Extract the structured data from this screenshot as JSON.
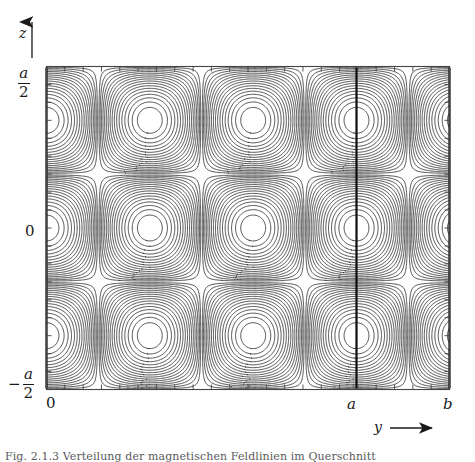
{
  "figure": {
    "type": "contour-plot",
    "axes": {
      "x": {
        "label": "y",
        "arrow": "right",
        "tick_labels": [
          "0",
          "a",
          "b"
        ],
        "tick_values": [
          0,
          1,
          1.3
        ],
        "range": [
          0,
          1.3
        ]
      },
      "y": {
        "label": "z",
        "arrow": "up",
        "tick_labels_top": "a",
        "tick_labels_top_den": "2",
        "tick_label_mid": "0",
        "tick_labels_bottom_sign": "−",
        "tick_labels_bottom": "a",
        "tick_labels_bottom_den": "2",
        "range": [
          -0.5,
          0.5
        ]
      }
    },
    "marker_lines": [
      {
        "name": "y-equals-0",
        "x": 0.0
      },
      {
        "name": "y-equals-a",
        "x": 1.0
      },
      {
        "name": "y-equals-b",
        "x": 1.3
      }
    ],
    "caption_sliver": "Fig. 2.1.3  Verteilung der magnetischen Feldlinien im Querschnitt"
  },
  "chart_data": {
    "type": "contour",
    "title": "",
    "xlabel": "y",
    "ylabel": "z",
    "xlim": [
      0,
      1.3
    ],
    "ylim": [
      -0.5,
      0.5
    ],
    "xticks": [
      0,
      1.0,
      1.3
    ],
    "xticklabels": [
      "0",
      "a",
      "b"
    ],
    "yticks": [
      -0.5,
      0,
      0.5
    ],
    "yticklabels": [
      "-a/2",
      "0",
      "a/2"
    ],
    "grid": false,
    "legend": null,
    "field_description": "Doubly periodic field: three cells along z (centred at z = -a/3, 0, +a/3) and three full cells along y within 0 <= y <= a, with a partly open fourth column between y = a and y = b where contours flatten into the corner.",
    "n_levels": 17,
    "cell_centers_x": [
      0.17,
      0.5,
      0.83,
      1.16
    ],
    "cell_centers_z": [
      0.33,
      0.0,
      -0.33
    ],
    "extrema_count": 9,
    "annotations": [
      {
        "text": "0",
        "axis": "x",
        "value": 0
      },
      {
        "text": "a",
        "axis": "x",
        "value": 1.0
      },
      {
        "text": "b",
        "axis": "x",
        "value": 1.3
      }
    ],
    "line_color": "#2b2b2b",
    "marker_line_color": "#000000",
    "frame_color": "#3a3a3a"
  },
  "colors": {
    "contour": "#2e2e2e",
    "thick_line": "#0d0d0d",
    "frame": "#444444",
    "text": "#1a1a1a",
    "background": "#ffffff"
  }
}
